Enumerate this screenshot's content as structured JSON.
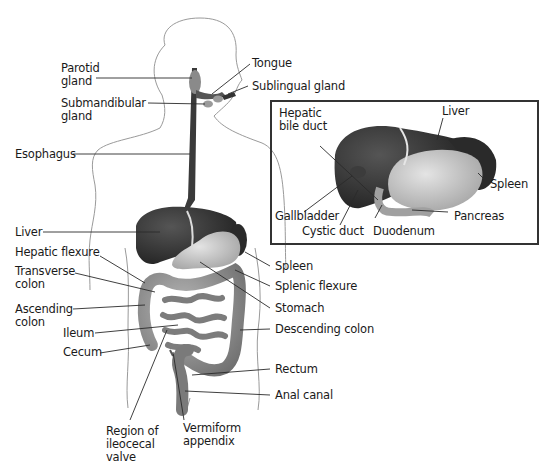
{
  "diagram": {
    "main_labels": {
      "parotid_gland": "Parotid\ngland",
      "tongue": "Tongue",
      "sublingual_gland": "Sublingual gland",
      "submandibular_gland": "Submandibular\ngland",
      "esophagus": "Esophagus",
      "liver": "Liver",
      "hepatic_flexure": "Hepatic flexure",
      "transverse_colon": "Transverse\ncolon",
      "ascending_colon": "Ascending\ncolon",
      "ileum": "Ileum",
      "cecum": "Cecum",
      "region_ileocecal_valve": "Region of\nileocecal\nvalve",
      "vermiform_appendix": "Vermiform\nappendix",
      "spleen": "Spleen",
      "splenic_flexure": "Splenic flexure",
      "stomach": "Stomach",
      "descending_colon": "Descending colon",
      "rectum": "Rectum",
      "anal_canal": "Anal canal"
    },
    "inset_labels": {
      "hepatic_bile_duct": "Hepatic\nbile duct",
      "liver": "Liver",
      "spleen": "Spleen",
      "gallbladder": "Gallbladder",
      "cystic_duct": "Cystic duct",
      "duodenum": "Duodenum",
      "pancreas": "Pancreas"
    },
    "colors": {
      "outline": "#9a9a9a",
      "leader": "#2a2a2a",
      "liver": "#2b2b2b",
      "stomach": "#bdbdbd",
      "intestine": "#8c8c8c",
      "esophagus": "#3a3a3a",
      "inset_border": "#333333"
    }
  }
}
